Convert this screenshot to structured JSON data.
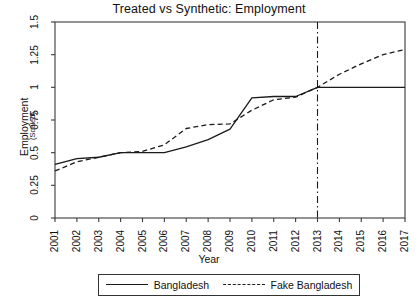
{
  "chart_data": {
    "type": "line",
    "title": "Treated vs Synthetic: Employment",
    "xlabel": "Year",
    "ylabel": "Employment",
    "ylabel_sub": "(Scaled)",
    "xlim": [
      2001,
      2017
    ],
    "ylim": [
      0,
      1.5
    ],
    "grid": false,
    "legend_position": "bottom",
    "x": [
      2001,
      2002,
      2003,
      2004,
      2005,
      2006,
      2007,
      2008,
      2009,
      2010,
      2011,
      2012,
      2013,
      2014,
      2015,
      2016,
      2017
    ],
    "xticklabels": [
      "2001",
      "2002",
      "2003",
      "2004",
      "2005",
      "2006",
      "2007",
      "2008",
      "2009",
      "2010",
      "2011",
      "2012",
      "2013",
      "2014",
      "2015",
      "2016",
      "2017"
    ],
    "yticks": [
      0,
      0.25,
      0.5,
      0.75,
      1,
      1.25,
      1.5
    ],
    "yticklabels": [
      "0",
      "0.25",
      "0.5",
      "0.75",
      "1",
      "1.25",
      "1.5"
    ],
    "series": [
      {
        "name": "Bangladesh",
        "style": "solid",
        "color": "#1a1a1a",
        "values": [
          0.41,
          0.455,
          0.465,
          0.5,
          0.5,
          0.5,
          0.545,
          0.6,
          0.68,
          0.92,
          0.93,
          0.93,
          1.0,
          1.0,
          1.0,
          1.0,
          1.0
        ]
      },
      {
        "name": "Fake Bangladesh",
        "style": "dashed",
        "color": "#1a1a1a",
        "values": [
          0.36,
          0.43,
          0.465,
          0.5,
          0.51,
          0.56,
          0.685,
          0.715,
          0.72,
          0.825,
          0.905,
          0.925,
          1.0,
          1.1,
          1.18,
          1.25,
          1.29
        ]
      }
    ],
    "vline": {
      "name": "treatment-year-line",
      "x": 2013,
      "style": "dash-dot",
      "color": "#1a1a1a"
    },
    "legend": [
      {
        "label": "Bangladesh",
        "style": "solid"
      },
      {
        "label": "Fake Bangladesh",
        "style": "dashed"
      }
    ]
  }
}
